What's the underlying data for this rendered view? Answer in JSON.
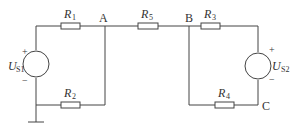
{
  "resistors": [
    {
      "id": "R1",
      "name": "R",
      "sub": "1"
    },
    {
      "id": "R2",
      "name": "R",
      "sub": "2"
    },
    {
      "id": "R3",
      "name": "R",
      "sub": "3"
    },
    {
      "id": "R4",
      "name": "R",
      "sub": "4"
    },
    {
      "id": "R5",
      "name": "R",
      "sub": "5"
    }
  ],
  "sources": [
    {
      "id": "US1",
      "name": "U",
      "sub": "S1",
      "plus": "+",
      "minus": "−"
    },
    {
      "id": "US2",
      "name": "U",
      "sub": "S2",
      "plus": "+",
      "minus": "−"
    }
  ],
  "nodes": {
    "A": "A",
    "B": "B",
    "C": "C"
  }
}
